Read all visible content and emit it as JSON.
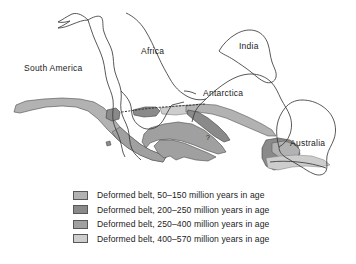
{
  "figure": {
    "background_color": "#ffffff"
  },
  "map": {
    "outline_color": "#3a3a3a",
    "dotted_line_color": "#2a2a2a",
    "labels": [
      {
        "name": "south-america",
        "text": "South America",
        "x": 24,
        "y": 71
      },
      {
        "name": "africa",
        "text": "Africa",
        "x": 141,
        "y": 54
      },
      {
        "name": "india",
        "text": "India",
        "x": 239,
        "y": 49
      },
      {
        "name": "antarctica",
        "text": "Antarctica",
        "x": 203,
        "y": 96
      },
      {
        "name": "australia",
        "text": "Australia",
        "x": 290,
        "y": 146
      }
    ]
  },
  "legend": {
    "title": "",
    "items": [
      {
        "id": "belt-50-150",
        "label": "Deformed belt, 50–150 million years in age",
        "color": "#b2b2b2",
        "age_min_my": 50,
        "age_max_my": 150
      },
      {
        "id": "belt-200-250",
        "label": "Deformed belt, 200–250 million years in age",
        "color": "#8a8a8a",
        "age_min_my": 200,
        "age_max_my": 250
      },
      {
        "id": "belt-250-400",
        "label": "Deformed belt, 250–400 million years in age",
        "color": "#a0a0a0",
        "age_min_my": 250,
        "age_max_my": 400
      },
      {
        "id": "belt-400-570",
        "label": "Deformed belt, 400–570 million years in age",
        "color": "#cdcdcd",
        "age_min_my": 400,
        "age_max_my": 570
      }
    ]
  }
}
